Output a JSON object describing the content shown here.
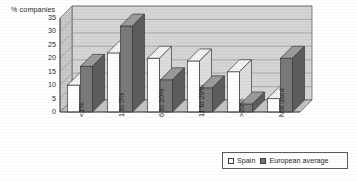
{
  "chart_data": {
    "type": "bar",
    "title": "",
    "ylabel": "% companies",
    "xlabel": "",
    "ylim": [
      0,
      35
    ],
    "yticks": [
      0,
      5,
      10,
      15,
      20,
      25,
      30,
      35
    ],
    "grid": true,
    "legend_position": "bottom-right",
    "categories": [
      "<1%",
      "1 to 5%",
      "6 to 10%",
      "11 to 20%",
      ">20%",
      "Not used"
    ],
    "series": [
      {
        "name": "Spain",
        "color": "#ffffff",
        "values": [
          10,
          22,
          20,
          19,
          15,
          5
        ]
      },
      {
        "name": "European average",
        "color": "#7a7a7a",
        "values": [
          17,
          32,
          12,
          9,
          3,
          20
        ]
      }
    ]
  },
  "legend": {
    "items": [
      {
        "label": "Spain",
        "swatch": "legend-swatch-spain"
      },
      {
        "label": "European average",
        "swatch": "legend-swatch-european-average"
      }
    ]
  }
}
